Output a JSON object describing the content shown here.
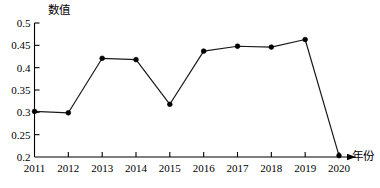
{
  "chart_data": {
    "type": "line",
    "title": "",
    "subtitle": "",
    "xlabel": "年份",
    "ylabel": "数值",
    "categories": [
      "2011",
      "2012",
      "2013",
      "2014",
      "2015",
      "2016",
      "2017",
      "2018",
      "2019",
      "2020"
    ],
    "values": [
      0.302,
      0.299,
      0.421,
      0.418,
      0.318,
      0.437,
      0.448,
      0.446,
      0.463,
      0.203
    ],
    "series": [
      {
        "name": "",
        "values": [
          0.302,
          0.299,
          0.421,
          0.418,
          0.318,
          0.437,
          0.448,
          0.446,
          0.463,
          0.203
        ]
      }
    ],
    "ylim": [
      0.2,
      0.5
    ],
    "xlim": [
      "2011",
      "2020"
    ],
    "yticks": [
      "0.5",
      "0.45",
      "0.4",
      "0.35",
      "0.3",
      "0.25",
      "0.2"
    ],
    "ytick_values": [
      0.5,
      0.45,
      0.4,
      0.35,
      0.3,
      0.25,
      0.2
    ],
    "xticks": [
      "2011",
      "2012",
      "2013",
      "2014",
      "2015",
      "2016",
      "2017",
      "2018",
      "2019",
      "2020"
    ],
    "grid": false,
    "legend": false,
    "legend_position": "none",
    "marker": "filled-circle",
    "line_color": "#1a1a1a",
    "marker_color": "#000000",
    "background_color": "#ffffff",
    "axis_color": "#000000",
    "x_axis_arrow": true,
    "y_axis_arrow": false,
    "annotations": []
  },
  "labels": {
    "y_axis_title": "数值",
    "x_axis_title": "年份"
  }
}
